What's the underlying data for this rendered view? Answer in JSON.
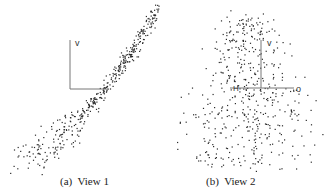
{
  "figure": {
    "panels": [
      {
        "id": "a",
        "caption": "(a)  View 1",
        "axis_labels": {
          "v": "v"
        },
        "scatter": {
          "shape": "curved-band",
          "n": 420,
          "seed": 7
        }
      },
      {
        "id": "b",
        "caption": "(b)  View 2",
        "axis_labels": {
          "v": "v",
          "o": "o",
          "h": "H"
        },
        "scatter": {
          "shape": "diffuse-cloud",
          "n": 520,
          "seed": 13
        }
      }
    ],
    "colors": {
      "points": "#2b2b2b",
      "axes": "#777777"
    }
  }
}
